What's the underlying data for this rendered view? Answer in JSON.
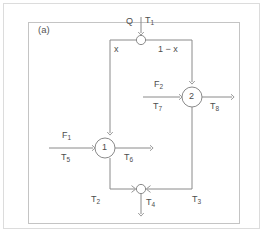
{
  "figure": {
    "panel_label": "(a)",
    "colors": {
      "line": "#8a8a8a",
      "frame": "#c9c9c9",
      "text": "#4d4d4d",
      "background": "#ffffff"
    }
  },
  "diagram": {
    "type": "process-flow-block-diagram",
    "nodes": [
      {
        "id": "splitter",
        "shape": "small-circle",
        "label": ""
      },
      {
        "id": "unit1",
        "shape": "circle",
        "label": "1"
      },
      {
        "id": "unit2",
        "shape": "circle",
        "label": "2"
      },
      {
        "id": "mixer",
        "shape": "small-circle",
        "label": ""
      }
    ],
    "labels": {
      "feed_flow": "Q",
      "feed_temp": "T",
      "feed_temp_sub": "1",
      "split_fraction_left": "x",
      "split_fraction_right": "1 − x",
      "unit1_name": "1",
      "unit2_name": "2",
      "unit1_side_flow": "F",
      "unit1_side_flow_sub": "1",
      "unit1_side_temp": "T",
      "unit1_side_temp_sub": "5",
      "unit1_out_temp": "T",
      "unit1_out_temp_sub": "6",
      "unit2_side_flow": "F",
      "unit2_side_flow_sub": "2",
      "unit2_side_temp": "T",
      "unit2_side_temp_sub": "7",
      "unit2_out_temp": "T",
      "unit2_out_temp_sub": "8",
      "mixer_in_left_temp": "T",
      "mixer_in_left_temp_sub": "2",
      "mixer_in_right_temp": "T",
      "mixer_in_right_temp_sub": "3",
      "mixer_out_temp": "T",
      "mixer_out_temp_sub": "4"
    }
  }
}
